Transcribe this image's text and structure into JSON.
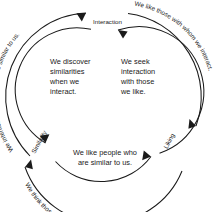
{
  "diagram": {
    "nodes": [
      {
        "id": "interaction",
        "label": "Interaction"
      },
      {
        "id": "similarity",
        "label": "Similarity"
      },
      {
        "id": "liking",
        "label": "Liking"
      }
    ],
    "inner_ring": {
      "direction": "counterclockwise",
      "segments": [
        {
          "id": "interaction-to-similarity",
          "from": "Interaction",
          "to": "Similarity",
          "lines": [
            "We discover",
            "similarities",
            "when we",
            "interact."
          ],
          "text": "We discover similarities when we interact."
        },
        {
          "id": "similarity-to-liking",
          "from": "Similarity",
          "to": "Liking",
          "lines": [
            "We like people who",
            "are similar to us."
          ],
          "text": "We like people who are similar to us."
        },
        {
          "id": "liking-to-interaction",
          "from": "Liking",
          "to": "Interaction",
          "lines": [
            "We seek",
            "interaction",
            "with those",
            "we like."
          ],
          "text": "We seek interaction with those we like."
        }
      ]
    },
    "outer_ring": {
      "direction": "clockwise",
      "segments": [
        {
          "id": "similarity-to-interaction",
          "from": "Similarity",
          "to": "Interaction",
          "text": "We interact with those who are similar to us."
        },
        {
          "id": "interaction-to-liking",
          "from": "Interaction",
          "to": "Liking",
          "text": "We like those with whom we interact."
        },
        {
          "id": "liking-to-similarity",
          "from": "Liking",
          "to": "Similarity",
          "text": "We think those we like are similar to us."
        }
      ]
    },
    "colors": {
      "stroke": "#1a1a1a",
      "background": "#ffffff",
      "text": "#1a1a1a"
    }
  }
}
